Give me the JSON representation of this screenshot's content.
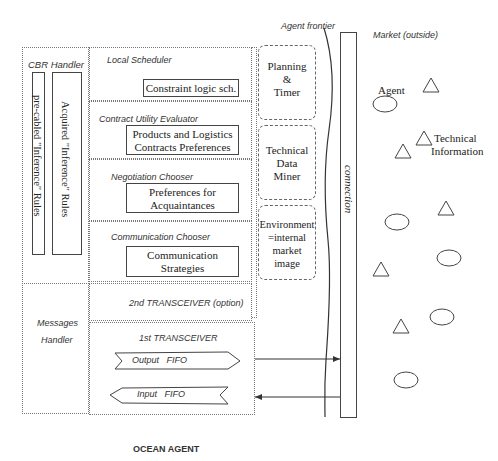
{
  "title": "OCEAN AGENT",
  "frontier_label": "Agent frontier",
  "market_label": "Market (outside)",
  "connection_label": "connection",
  "cbr_handler": {
    "label": "CBR Handler",
    "rules": [
      "pre-cabled \"Inference\" Rules",
      "Acquired \"Inference\" Rules"
    ]
  },
  "messages_handler": {
    "line1": "Messages",
    "line2": "Handler"
  },
  "modules": [
    {
      "label": "Local Scheduler",
      "box": [
        "Constraint logic sch."
      ]
    },
    {
      "label": "Contract Utility Evaluator",
      "box": [
        "Products and Logistics",
        "Contracts Preferences"
      ]
    },
    {
      "label": "Negotiation Chooser",
      "box": [
        "Preferences for",
        "Acquaintances"
      ]
    },
    {
      "label": "Communication Chooser",
      "box": [
        "Communication",
        "Strategies"
      ]
    }
  ],
  "second_transceiver": "2nd TRANSCEIVER (option)",
  "first_transceiver": {
    "label": "1st TRANSCEIVER",
    "output": "Output   FIFO",
    "input": "Input   FIFO"
  },
  "side_modules": [
    {
      "lines": [
        "Planning",
        "&",
        "Timer"
      ]
    },
    {
      "lines": [
        "Technical",
        "Data",
        "Miner"
      ]
    },
    {
      "lines": [
        "Environment",
        "=internal",
        "market",
        "image"
      ]
    }
  ],
  "market": {
    "agent_label": "Agent",
    "technical_info_label": [
      "Technical",
      "Information"
    ]
  }
}
